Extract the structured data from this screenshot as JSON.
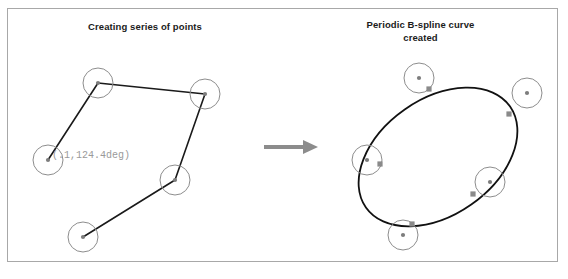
{
  "figure": {
    "width": 568,
    "height": 279,
    "background_color": "#ffffff",
    "border_color": "#a8a8a8"
  },
  "panels": [
    {
      "id": "creating-points",
      "title": "Creating series of points",
      "annotation": "(.1,124.4deg)",
      "annotation_color": "#9a9a9a"
    },
    {
      "id": "bspline-created",
      "title_line_1": "Periodic B-spline curve",
      "title_line_2": "created"
    }
  ],
  "arrow": {
    "label": "transforms-into",
    "color": "#8c8c8c"
  },
  "colors": {
    "circle_stroke": "#8d8d8d",
    "point_fill": "#7d7d7d",
    "polyline": "#1a1a1a",
    "curve": "#111111",
    "marker": "#8a8a8a",
    "title_text": "#1b1b1b"
  },
  "chart_data": {
    "type": "scatter",
    "xlabel": "",
    "ylabel": "",
    "xlim": [
      0,
      568
    ],
    "ylim": [
      0,
      279
    ],
    "grid": false,
    "legend": "none",
    "series": [
      {
        "name": "control points (left panel)",
        "marker_radius": 15,
        "points": [
          {
            "label": "P1",
            "x": 98,
            "y": 83
          },
          {
            "label": "P2",
            "x": 205,
            "y": 94
          },
          {
            "label": "P3",
            "x": 48,
            "y": 160
          },
          {
            "label": "P4",
            "x": 175,
            "y": 180
          },
          {
            "label": "P5",
            "x": 83,
            "y": 237
          }
        ],
        "polyline_order": [
          "P3",
          "P1",
          "P2",
          "P4",
          "P5"
        ]
      },
      {
        "name": "control points (right panel)",
        "marker_radius": 15,
        "points": [
          {
            "label": "Q1",
            "x": 419,
            "y": 78
          },
          {
            "label": "Q2",
            "x": 527,
            "y": 93
          },
          {
            "label": "Q3",
            "x": 367,
            "y": 160
          },
          {
            "label": "Q4",
            "x": 490,
            "y": 182
          },
          {
            "label": "Q5",
            "x": 403,
            "y": 235
          }
        ]
      },
      {
        "name": "periodic b-spline curve",
        "shape": "closed-ellipse",
        "center_x": 438,
        "center_y": 157,
        "radius_x": 88,
        "radius_y": 58,
        "rotation_deg": -35
      },
      {
        "name": "curve touch markers",
        "points": [
          {
            "x": 429,
            "y": 89
          },
          {
            "x": 509,
            "y": 114
          },
          {
            "x": 380,
            "y": 164
          },
          {
            "x": 473,
            "y": 194
          },
          {
            "x": 412,
            "y": 224
          }
        ]
      }
    ]
  }
}
